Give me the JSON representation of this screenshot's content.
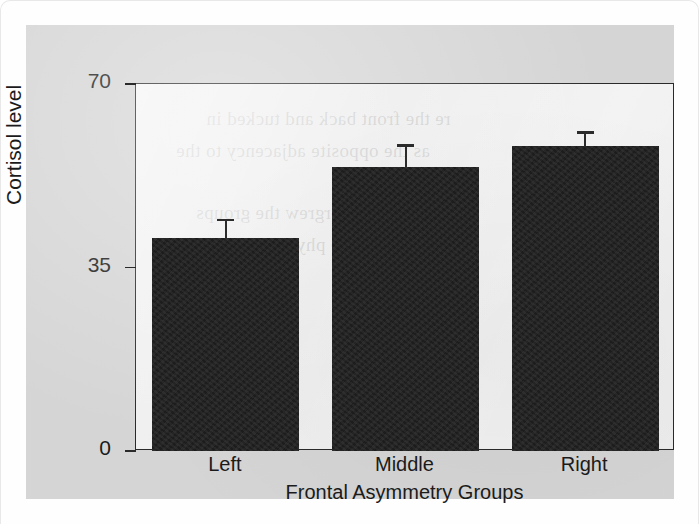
{
  "figure": {
    "panel_background": "#d5d5d5",
    "plot_background": "#e9e9e9",
    "bar_color": "#1d1d1d",
    "axis_color": "#2a2a2a"
  },
  "chart_data": {
    "type": "bar",
    "title": "",
    "subtitle": "",
    "xlabel": "Frontal Asymmetry Groups",
    "ylabel": "Cortisol level",
    "categories": [
      "Left",
      "Middle",
      "Right"
    ],
    "values": [
      40.7,
      54.1,
      58.1
    ],
    "errors": [
      3.6,
      4.4,
      2.9
    ],
    "series": [
      {
        "name": "Cortisol level",
        "values": [
          40.7,
          54.1,
          58.1
        ],
        "errors": [
          3.6,
          4.4,
          2.9
        ]
      }
    ],
    "ylim": [
      0,
      70
    ],
    "yticks": [
      0,
      35,
      70
    ],
    "ytick_labels": [
      "0",
      "35",
      "70"
    ],
    "xtick_labels": [
      "Left",
      "Middle",
      "Right"
    ],
    "grid": false,
    "legend": false,
    "legend_position": "none",
    "error_bar_style": "upper-cap-only",
    "annotations": []
  },
  "bleed_text": {
    "line1": "re the front back and tucked in",
    "line2": "as the opposite adjacency to the",
    "line3": "ogy overgrew the groups",
    "line4": "oderate physiological levels"
  }
}
